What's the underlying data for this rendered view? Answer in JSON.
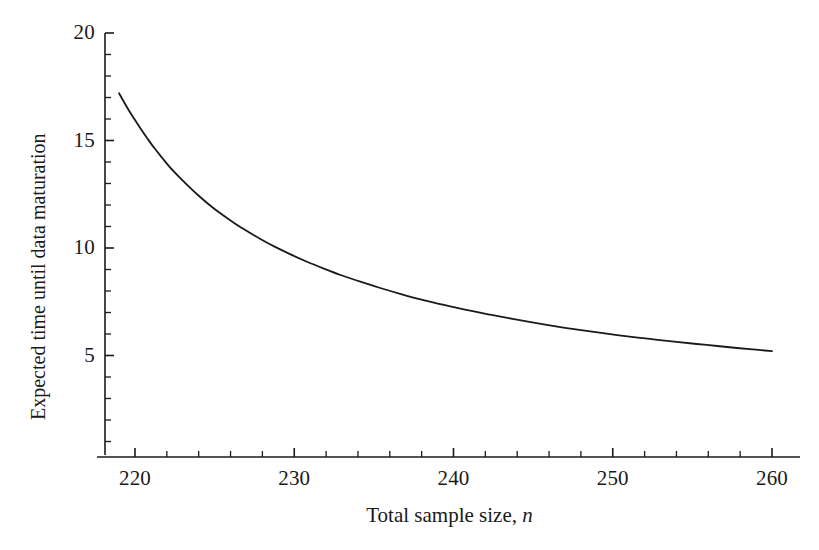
{
  "chart_data": {
    "type": "line",
    "title": "",
    "subtitle": "",
    "xlabel": "Total sample size, n",
    "xlabel_plain": "Total sample size, ",
    "xlabel_variable": "n",
    "ylabel": "Expected time until data maturation",
    "xlim": [
      218.0,
      261.0
    ],
    "ylim": [
      0.0,
      20.0
    ],
    "grid": false,
    "legend": null,
    "legend_position": "none",
    "line_color": "#1a1a1a",
    "line_width_px": 1.8,
    "background_color": "#ffffff",
    "axis_color": "#1a1a1a",
    "x_major_ticks": [
      220,
      230,
      240,
      250,
      260
    ],
    "x_major_tick_labels": [
      "220",
      "230",
      "240",
      "250",
      "260"
    ],
    "x_minor_tick_step": 2,
    "y_major_ticks": [
      5,
      10,
      15,
      20
    ],
    "y_major_tick_labels": [
      "5",
      "10",
      "15",
      "20"
    ],
    "y_minor_tick_step": 1,
    "y_axis_visible_min": 0.1,
    "series": [
      {
        "name": "Expected time until data maturation",
        "x": [
          219.0,
          219.3,
          219.6,
          220.0,
          220.4,
          220.8,
          221.2,
          221.7,
          222.2,
          222.8,
          223.4,
          224.0,
          224.7,
          225.4,
          226.2,
          227.0,
          227.9,
          228.8,
          229.8,
          230.8,
          231.9,
          233.0,
          234.2,
          235.4,
          236.7,
          238.0,
          239.4,
          240.8,
          242.3,
          243.8,
          245.4,
          247.0,
          248.7,
          250.4,
          252.2,
          254.0,
          255.9,
          257.8,
          259.0,
          260.0
        ],
        "y": [
          17.2,
          16.8,
          16.42,
          15.95,
          15.5,
          15.07,
          14.66,
          14.2,
          13.75,
          13.28,
          12.84,
          12.43,
          11.99,
          11.59,
          11.18,
          10.8,
          10.41,
          10.05,
          9.69,
          9.36,
          9.03,
          8.72,
          8.42,
          8.14,
          7.86,
          7.6,
          7.35,
          7.12,
          6.9,
          6.69,
          6.48,
          6.29,
          6.11,
          5.94,
          5.78,
          5.63,
          5.49,
          5.35,
          5.27,
          5.2
        ]
      }
    ],
    "annotations": []
  },
  "axes": {
    "y_ticks": [
      {
        "value": 20,
        "label": "20"
      },
      {
        "value": 15,
        "label": "15"
      },
      {
        "value": 10,
        "label": "10"
      },
      {
        "value": 5,
        "label": "5"
      }
    ],
    "x_ticks": [
      {
        "value": 220,
        "label": "220"
      },
      {
        "value": 230,
        "label": "230"
      },
      {
        "value": 240,
        "label": "240"
      },
      {
        "value": 250,
        "label": "250"
      },
      {
        "value": 260,
        "label": "260"
      }
    ]
  }
}
